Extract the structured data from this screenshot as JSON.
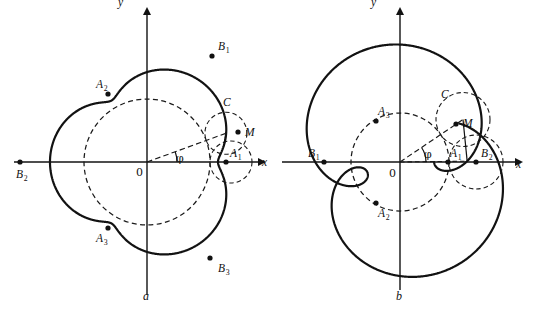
{
  "figure": {
    "background": "#ffffff",
    "ink": "#121212",
    "width": 534,
    "height": 316
  },
  "panel_a": {
    "caption": "a",
    "axis_x_label": "x",
    "axis_y_label": "y",
    "origin_label": "0",
    "angle_label": "φ",
    "center": {
      "x": 147,
      "y": 162
    },
    "base_radius": 63,
    "rolling_radius": 21,
    "lambda": 0.62,
    "cusp_count": 3,
    "phi_deg": 20,
    "points": [
      {
        "name": "A1",
        "base": "A",
        "sub": "1",
        "x": 226,
        "y": 162
      },
      {
        "name": "A2",
        "base": "A",
        "sub": "2",
        "x": 108,
        "y": 94
      },
      {
        "name": "A3",
        "base": "A",
        "sub": "3",
        "x": 108,
        "y": 228
      },
      {
        "name": "B1",
        "base": "B",
        "sub": "1",
        "x": 212,
        "y": 56
      },
      {
        "name": "B2",
        "base": "B",
        "sub": "2",
        "x": 20,
        "y": 162
      },
      {
        "name": "B3",
        "base": "B",
        "sub": "3",
        "x": 210,
        "y": 258
      },
      {
        "name": "C",
        "base": "C",
        "sub": "",
        "x": 225,
        "y": 112
      },
      {
        "name": "M",
        "base": "M",
        "sub": "",
        "x": 238,
        "y": 132
      }
    ]
  },
  "panel_b": {
    "caption": "b",
    "axis_x_label": "x",
    "axis_y_label": "y",
    "origin_label": "0",
    "angle_label": "φ",
    "center": {
      "x": 400,
      "y": 162
    },
    "base_radius": 49,
    "rolling_radius": 27,
    "lambda": 1.55,
    "loop_count": 3,
    "phi_deg": 34,
    "points": [
      {
        "name": "A1",
        "base": "A",
        "sub": "1",
        "x": 448,
        "y": 162
      },
      {
        "name": "A2",
        "base": "A",
        "sub": "2",
        "x": 376,
        "y": 203
      },
      {
        "name": "A3",
        "base": "A",
        "sub": "3",
        "x": 376,
        "y": 121
      },
      {
        "name": "B1",
        "base": "B",
        "sub": "1",
        "x": 324,
        "y": 162
      },
      {
        "name": "B2",
        "base": "B",
        "sub": "2",
        "x": 476,
        "y": 162
      },
      {
        "name": "C",
        "base": "C",
        "sub": "",
        "x": 443,
        "y": 104
      },
      {
        "name": "M",
        "base": "M",
        "sub": "",
        "x": 456,
        "y": 124
      }
    ]
  },
  "chart_data": {
    "type": "line",
    "xlabel": "x",
    "ylabel": "y",
    "grid": false,
    "legend": false,
    "series": [
      {
        "name": "panel_a_epitrochoid",
        "equation": "x = (R+r)cos t - λ r cos((R+r)t/r), y = (R+r)sin t - λ r sin((R+r)t/r)",
        "R": 63,
        "r": 21,
        "lambda": 0.62,
        "cusps": 3,
        "cusp_labels": [
          "A1",
          "A2",
          "A3"
        ],
        "apex_labels": [
          "B1",
          "B2",
          "B3"
        ]
      },
      {
        "name": "panel_b_epitrochoid",
        "equation": "x = (R+r)cos t - λ r cos((R+r)t/r), y = (R+r)sin t - λ r sin((R+r)t/r)",
        "R": 49,
        "r": 27,
        "lambda": 1.55,
        "loops": 3,
        "node_labels": [
          "A1",
          "A2",
          "A3"
        ],
        "apex_labels": [
          "B1",
          "B2"
        ]
      }
    ]
  }
}
